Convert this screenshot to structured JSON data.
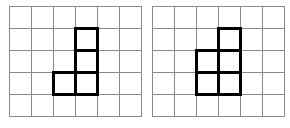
{
  "figure": {
    "background_color": "#ffffff",
    "grid_line_color": "#8a8a8a",
    "shape_outline_color": "#000000",
    "shape_fill_color": "#ffffff",
    "panel_count": 2
  },
  "panels": [
    {
      "id": "left",
      "name": "left-grid",
      "label": "",
      "origin_x": 9,
      "origin_y": 6,
      "columns": 6,
      "rows": 5,
      "cell_size": 22,
      "shape": {
        "name": "j-tetromino",
        "cell_count": 4,
        "cells": [
          {
            "col": 3,
            "row": 1
          },
          {
            "col": 3,
            "row": 2
          },
          {
            "col": 3,
            "row": 3
          },
          {
            "col": 2,
            "row": 3
          }
        ]
      }
    },
    {
      "id": "right",
      "name": "right-grid",
      "label": "",
      "origin_x": 152,
      "origin_y": 6,
      "columns": 6,
      "rows": 5,
      "cell_size": 22,
      "shape": {
        "name": "p-pentomino",
        "cell_count": 5,
        "cells": [
          {
            "col": 3,
            "row": 1
          },
          {
            "col": 3,
            "row": 2
          },
          {
            "col": 3,
            "row": 3
          },
          {
            "col": 2,
            "row": 2
          },
          {
            "col": 2,
            "row": 3
          }
        ]
      }
    }
  ]
}
